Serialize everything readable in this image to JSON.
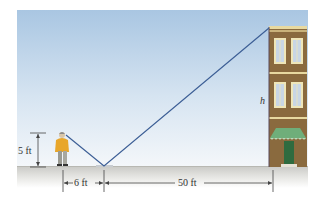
{
  "diagram": {
    "labels": {
      "person_height": "5 ft",
      "person_to_mirror": "6 ft",
      "mirror_to_building": "50 ft",
      "building_height": "h"
    },
    "colors": {
      "sky_top": "#a9c6e2",
      "sky_bottom": "#f2f6fa",
      "ground_top": "#d4d4d0",
      "ground_bottom": "#ffffff",
      "sight_line": "#3d5f96",
      "building_facade": "#8a6a3e",
      "building_trim": "#e8d9a0",
      "window_frame": "#efe6b8",
      "window_glass": "#c9d6e4",
      "awning": "#6fae7a",
      "door": "#2f6b3f",
      "person_shirt": "#e8a62a",
      "person_pants": "#9a9a92",
      "dimension_line": "#444444"
    }
  }
}
